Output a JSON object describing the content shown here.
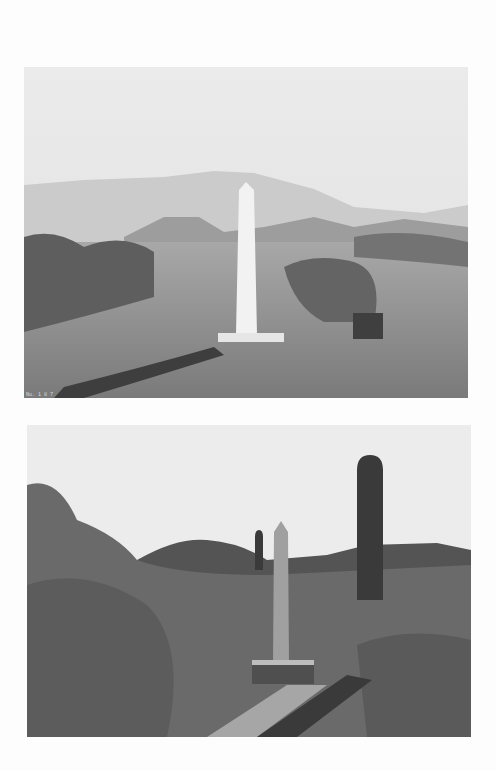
{
  "page": {
    "background": "#fdfdfd",
    "photos": [
      {
        "id": "top",
        "subject": "white stone obelisk border monument in desert with mountains",
        "caption": "No. 1 8 7",
        "colors": {
          "sky": "#e9e9e9",
          "mountains": "#c8c8c8",
          "ground": "#8a8a8a",
          "brush": "#5a5a5a",
          "obelisk": "#f2f2f2"
        }
      },
      {
        "id": "bottom",
        "subject": "obelisk border monument among desert brush and saguaro cacti",
        "colors": {
          "sky": "#ececec",
          "hill": "#505050",
          "brush": "#6a6a6a",
          "obelisk": "#9a9a9a",
          "cactus": "#3a3a3a"
        }
      }
    ]
  }
}
